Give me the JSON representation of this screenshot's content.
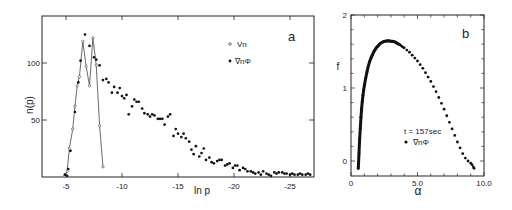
{
  "chart_data": [
    {
      "panel": "a",
      "type": "scatter",
      "title": "",
      "xlabel": "ln p",
      "ylabel": "n(p)",
      "xlim": [
        -2.8,
        -27.3
      ],
      "ylim": [
        0,
        141
      ],
      "x_ticks": [
        -5,
        -10,
        -15,
        -20,
        -25
      ],
      "x_tick_labels": [
        "-5",
        "-10",
        "-15",
        "-20",
        "-25"
      ],
      "y_ticks": [
        50,
        100
      ],
      "y_tick_labels": [
        "50",
        "100"
      ],
      "grid": false,
      "legend_position": "upper right",
      "series": [
        {
          "name": "Vn",
          "marker": "open-circle",
          "connected": true,
          "x": [
            -4.9,
            -5.1,
            -5.3,
            -5.6,
            -5.8,
            -6.0,
            -6.2,
            -6.5,
            -6.8,
            -7.1,
            -7.4,
            -7.7,
            -8.0,
            -8.3
          ],
          "values": [
            1,
            5,
            25,
            42,
            62,
            80,
            88,
            119,
            97,
            80,
            122,
            98,
            45,
            9
          ]
        },
        {
          "name": "∇nΦ",
          "marker": "filled-circle",
          "connected": false,
          "x": [
            -4.9,
            -5.1,
            -5.2,
            -5.4,
            -5.8,
            -6.1,
            -6.3,
            -6.7,
            -7.1,
            -7.5,
            -7.7,
            -8.0,
            -8.3,
            -8.6,
            -8.8,
            -9.1,
            -9.3,
            -9.6,
            -9.8,
            -10.0,
            -10.2,
            -10.4,
            -10.6,
            -10.9,
            -11.1,
            -11.3,
            -11.5,
            -11.8,
            -12.0,
            -12.3,
            -12.5,
            -12.7,
            -12.9,
            -13.2,
            -13.4,
            -13.6,
            -13.8,
            -14.1,
            -14.3,
            -14.6,
            -14.8,
            -15.0,
            -15.3,
            -15.5,
            -15.7,
            -16.0,
            -16.2,
            -16.4,
            -16.6,
            -16.9,
            -17.1,
            -17.3,
            -17.5,
            -17.8,
            -18.0,
            -18.2,
            -18.5,
            -18.7,
            -18.9,
            -19.2,
            -19.4,
            -19.6,
            -19.9,
            -20.1,
            -20.3,
            -20.5,
            -20.8,
            -21.0,
            -21.2,
            -21.5,
            -21.7,
            -21.9,
            -22.2,
            -22.4,
            -22.6,
            -22.9,
            -23.1,
            -23.3,
            -23.6,
            -23.8,
            -24.0,
            -24.3,
            -24.5,
            -24.7,
            -25.0,
            -25.2,
            -25.4,
            -25.7,
            -25.9,
            -26.1,
            -26.4,
            -26.6,
            -26.8
          ],
          "values": [
            2,
            1,
            7,
            23,
            57,
            83,
            102,
            125,
            115,
            105,
            103,
            98,
            85,
            86,
            83,
            74,
            79,
            74,
            78,
            71,
            69,
            72,
            55,
            62,
            68,
            66,
            66,
            60,
            56,
            55,
            53,
            55,
            54,
            51,
            51,
            51,
            46,
            53,
            55,
            36,
            42,
            38,
            35,
            38,
            34,
            31,
            24,
            20,
            27,
            18,
            21,
            25,
            15,
            17,
            13,
            12,
            14,
            15,
            15,
            10,
            11,
            12,
            8,
            10,
            10,
            6,
            8,
            7,
            5,
            5,
            4,
            3,
            4,
            2,
            5,
            3,
            2,
            1,
            4,
            3,
            4,
            4,
            3,
            3,
            2,
            3,
            2,
            2,
            3,
            2,
            2,
            3,
            2
          ]
        }
      ],
      "legend": [
        {
          "label": "Vn",
          "marker": "open-circle"
        },
        {
          "label": "∇nΦ",
          "marker": "filled-circle"
        }
      ]
    },
    {
      "panel": "b",
      "type": "scatter",
      "title": "",
      "xlabel": "α",
      "ylabel": "f",
      "xlim": [
        0,
        10.0
      ],
      "ylim": [
        -0.2,
        2
      ],
      "x_ticks": [
        0,
        5.0,
        10.0
      ],
      "x_tick_labels": [
        "0",
        "5.0",
        "10.0"
      ],
      "y_ticks": [
        0,
        1,
        2
      ],
      "y_tick_labels": [
        "0",
        "1",
        "2"
      ],
      "grid": false,
      "annotation": "t = 157sec",
      "series": [
        {
          "name": "∇nΦ",
          "marker": "filled-circle",
          "x": [
            0.55,
            0.6,
            0.65,
            0.7,
            0.75,
            0.8,
            0.85,
            0.9,
            0.95,
            1.0,
            1.1,
            1.2,
            1.3,
            1.4,
            1.5,
            1.6,
            1.7,
            1.8,
            1.9,
            2.0,
            2.1,
            2.2,
            2.3,
            2.4,
            2.5,
            2.6,
            2.7,
            2.8,
            2.9,
            3.0,
            3.1,
            3.2,
            3.3,
            3.4,
            3.5,
            3.6,
            3.7,
            3.8,
            3.9,
            4.0,
            4.2,
            4.4,
            4.6,
            4.8,
            5.0,
            5.2,
            5.4,
            5.6,
            5.8,
            6.0,
            6.2,
            6.4,
            6.6,
            6.8,
            7.0,
            7.2,
            7.4,
            7.6,
            7.8,
            8.0,
            8.2,
            8.4,
            8.6,
            8.8,
            9.0,
            9.1,
            9.2,
            9.25
          ],
          "values": [
            -0.1,
            0.1,
            0.3,
            0.45,
            0.6,
            0.72,
            0.82,
            0.9,
            0.97,
            1.03,
            1.13,
            1.22,
            1.3,
            1.36,
            1.41,
            1.45,
            1.49,
            1.52,
            1.55,
            1.57,
            1.59,
            1.61,
            1.62,
            1.63,
            1.64,
            1.64,
            1.645,
            1.645,
            1.645,
            1.64,
            1.64,
            1.635,
            1.63,
            1.62,
            1.61,
            1.6,
            1.59,
            1.575,
            1.56,
            1.55,
            1.52,
            1.49,
            1.45,
            1.41,
            1.37,
            1.32,
            1.27,
            1.21,
            1.15,
            1.09,
            1.02,
            0.95,
            0.87,
            0.79,
            0.71,
            0.62,
            0.53,
            0.44,
            0.35,
            0.26,
            0.18,
            0.1,
            0.04,
            0.0,
            -0.03,
            -0.05,
            -0.08,
            -0.1
          ]
        }
      ],
      "legend": [
        {
          "label": "∇nΦ",
          "marker": "filled-circle"
        }
      ]
    }
  ],
  "panel_a": {
    "label": "a",
    "ylabel": "n(p)",
    "xlabel": "ln p",
    "y_ticks": [
      "50",
      "100"
    ],
    "x_ticks": [
      "-5",
      "-10",
      "-15",
      "-20",
      "-25"
    ],
    "legend": [
      {
        "label": "Vn"
      },
      {
        "label": "∇nΦ"
      }
    ]
  },
  "panel_b": {
    "label": "b",
    "ylabel": "f",
    "xlabel": "α",
    "y_ticks": [
      "0",
      "1",
      "2"
    ],
    "x_ticks": [
      "0",
      "5.0",
      "10.0"
    ],
    "annotation": "t = 157sec",
    "legend_label": "∇nΦ"
  }
}
